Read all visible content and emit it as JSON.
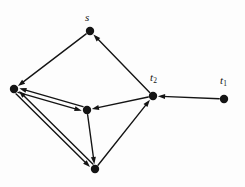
{
  "figure": {
    "type": "directed-graph",
    "width": 245,
    "height": 187,
    "background_color": "#fdfdfd",
    "ink_color": "#141414",
    "node_radius": 4.2,
    "stroke_width": 1.4,
    "ghost_artifact": "",
    "nodes": [
      {
        "id": "s",
        "label": "s",
        "has_label": true,
        "x": 90,
        "y": 31,
        "label_x": 85,
        "label_y": 12
      },
      {
        "id": "a",
        "label": "",
        "has_label": false,
        "x": 14,
        "y": 89,
        "label_x": 0,
        "label_y": 0
      },
      {
        "id": "b",
        "label": "",
        "has_label": false,
        "x": 87,
        "y": 110,
        "label_x": 0,
        "label_y": 0
      },
      {
        "id": "c",
        "label": "",
        "has_label": false,
        "x": 95,
        "y": 169,
        "label_x": 0,
        "label_y": 0
      },
      {
        "id": "t2",
        "label": "t",
        "sub": "2",
        "has_label": true,
        "x": 153,
        "y": 96,
        "label_x": 150,
        "label_y": 72
      },
      {
        "id": "t1",
        "label": "t",
        "sub": "1",
        "has_label": true,
        "x": 224,
        "y": 99,
        "label_x": 220,
        "label_y": 75
      }
    ],
    "edges": [
      {
        "from": "s",
        "to": "a",
        "directed": true,
        "double": false,
        "note": "s to left node"
      },
      {
        "from": "t2",
        "to": "s",
        "directed": true,
        "double": false,
        "note": "t2 up to s"
      },
      {
        "from": "a",
        "to": "b",
        "directed": true,
        "double": true,
        "note": "left to middle, doubled"
      },
      {
        "from": "b",
        "to": "a",
        "directed": true,
        "double": true,
        "note": "middle to left, doubled"
      },
      {
        "from": "a",
        "to": "c",
        "directed": true,
        "double": true,
        "note": "left to bottom, doubled"
      },
      {
        "from": "c",
        "to": "a",
        "directed": true,
        "double": true,
        "note": "bottom to left, doubled"
      },
      {
        "from": "t2",
        "to": "b",
        "directed": true,
        "double": false,
        "note": "t2 to middle"
      },
      {
        "from": "b",
        "to": "c",
        "directed": true,
        "double": false,
        "note": "middle down to bottom"
      },
      {
        "from": "c",
        "to": "t2",
        "directed": true,
        "double": false,
        "note": "bottom up to t2"
      },
      {
        "from": "t1",
        "to": "t2",
        "directed": true,
        "double": false,
        "note": "t1 to t2"
      }
    ]
  }
}
